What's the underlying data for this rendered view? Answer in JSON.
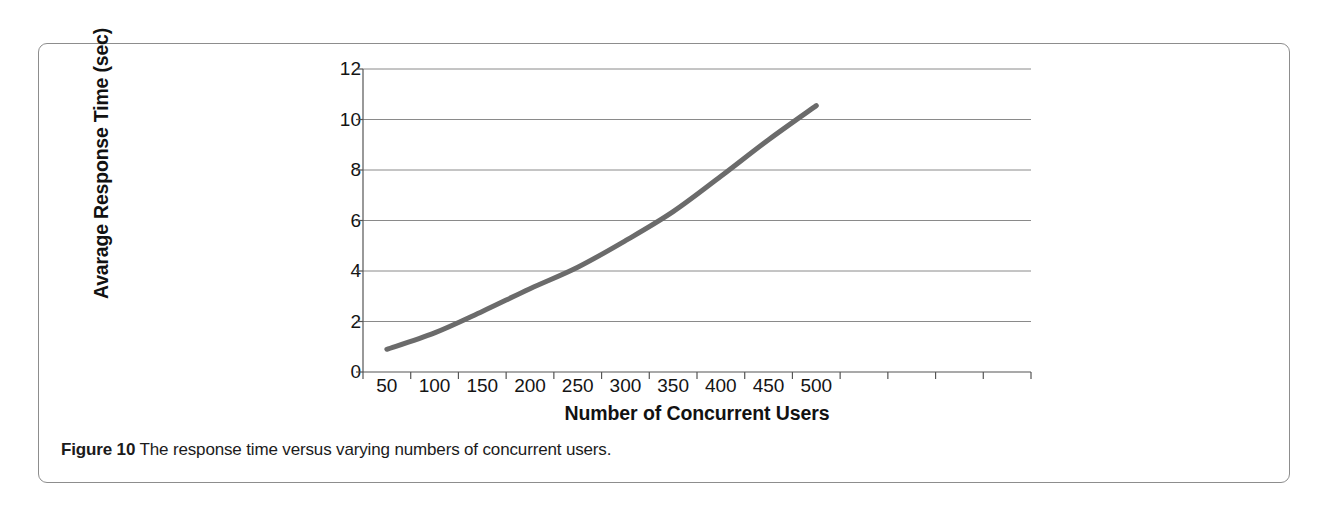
{
  "figure": {
    "caption_label": "Figure 10",
    "caption_text": "The response time versus varying numbers of concurrent users."
  },
  "chart_data": {
    "type": "line",
    "title": "",
    "xlabel": "Number of Concurrent Users",
    "ylabel": "Avarage Response Time (sec)",
    "x": [
      50,
      100,
      150,
      200,
      250,
      300,
      350,
      400,
      450,
      500
    ],
    "values": [
      0.9,
      1.55,
      2.4,
      3.3,
      4.15,
      5.2,
      6.35,
      7.75,
      9.2,
      10.55
    ],
    "series": [
      {
        "name": "Average response time",
        "values": [
          0.9,
          1.55,
          2.4,
          3.3,
          4.15,
          5.2,
          6.35,
          7.75,
          9.2,
          10.55
        ]
      }
    ],
    "xtick_labels": [
      "50",
      "100",
      "150",
      "200",
      "250",
      "300",
      "350",
      "400",
      "450",
      "500"
    ],
    "ytick_labels": [
      "0",
      "2",
      "4",
      "6",
      "8",
      "10",
      "12"
    ],
    "yticks": [
      0,
      2,
      4,
      6,
      8,
      10,
      12
    ],
    "ylim": [
      0,
      12
    ],
    "xlim": [
      25,
      550
    ],
    "grid": true,
    "grid_axis": "y",
    "legend": false,
    "legend_position": "none",
    "line_color": "#6b6b6b",
    "line_width": 5,
    "axis_color": "#555555",
    "grid_color": "#8a8a8a"
  }
}
